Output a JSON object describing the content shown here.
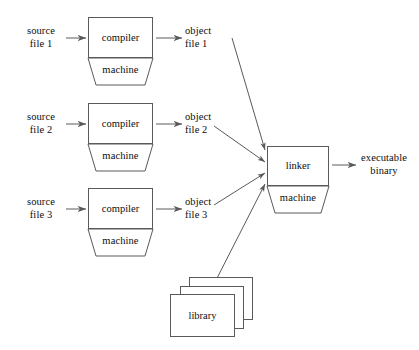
{
  "diagram": {
    "background_color": "#ffffff",
    "stroke_color": "#5a5a5a",
    "text_color": "#0d0d0d",
    "inputs": [
      {
        "label": "source\nfile 1"
      },
      {
        "label": "source\nfile 2"
      },
      {
        "label": "source\nfile 3"
      }
    ],
    "compilers": [
      {
        "top_label": "compiler",
        "bottom_label": "machine"
      },
      {
        "top_label": "compiler",
        "bottom_label": "machine"
      },
      {
        "top_label": "compiler",
        "bottom_label": "machine"
      }
    ],
    "objects": [
      {
        "label": "object\nfile 1"
      },
      {
        "label": "object\nfile 2"
      },
      {
        "label": "object\nfile 3"
      }
    ],
    "linker": {
      "top_label": "linker",
      "bottom_label": "machine"
    },
    "library": {
      "label": "library",
      "copies": 3
    },
    "output": {
      "label": "executable\nbinary"
    }
  }
}
